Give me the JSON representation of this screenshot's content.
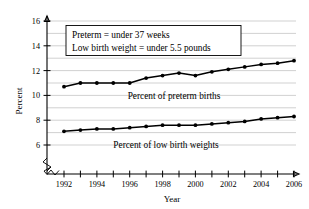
{
  "chart_data": {
    "type": "line",
    "title": "",
    "xlabel": "Year",
    "ylabel": "Percent",
    "x": [
      1992,
      1993,
      1994,
      1995,
      1996,
      1997,
      1998,
      1999,
      2000,
      2001,
      2002,
      2003,
      2004,
      2005,
      2006
    ],
    "xlim": [
      1991.4,
      2006.8
    ],
    "ylim": [
      5.3,
      16.6
    ],
    "y_ticks": [
      6,
      8,
      10,
      12,
      14,
      16
    ],
    "y_tick_labels": [
      "6",
      "8",
      "10",
      "12",
      "14",
      "16"
    ],
    "x_ticks": [
      1992,
      1993,
      1994,
      1995,
      1996,
      1997,
      1998,
      1999,
      2000,
      2001,
      2002,
      2003,
      2004,
      2005,
      2006
    ],
    "x_tick_labels": [
      "1992",
      "",
      "1994",
      "",
      "1996",
      "",
      "1998",
      "",
      "2000",
      "",
      "2002",
      "",
      "2004",
      "",
      "2006"
    ],
    "x_labeled_years": [
      "1992",
      "1994",
      "1996",
      "1998",
      "2000",
      "2002",
      "2004",
      "2006"
    ],
    "grid": true,
    "grid_axis": "y",
    "y_axis_broken": true,
    "y_axis_break_below": 6,
    "legend_position": "inline-annotation",
    "series": [
      {
        "name": "Percent of preterm births",
        "label": "Percent of preterm births",
        "color": "#000000",
        "marker": "circle",
        "values": [
          10.7,
          11.0,
          11.0,
          11.0,
          11.0,
          11.4,
          11.6,
          11.8,
          11.6,
          11.9,
          12.1,
          12.3,
          12.5,
          12.6,
          12.8
        ]
      },
      {
        "name": "Percent of low birth weights",
        "label": "Percent of low birth weights",
        "color": "#000000",
        "marker": "circle",
        "values": [
          7.1,
          7.2,
          7.3,
          7.3,
          7.4,
          7.5,
          7.6,
          7.6,
          7.6,
          7.7,
          7.8,
          7.9,
          8.1,
          8.2,
          8.3
        ]
      }
    ],
    "annotations": [
      {
        "name": "definitions-note-box",
        "lines": [
          "Preterm = under 37 weeks",
          "Low birth weight = under 5.5 pounds"
        ]
      }
    ]
  }
}
